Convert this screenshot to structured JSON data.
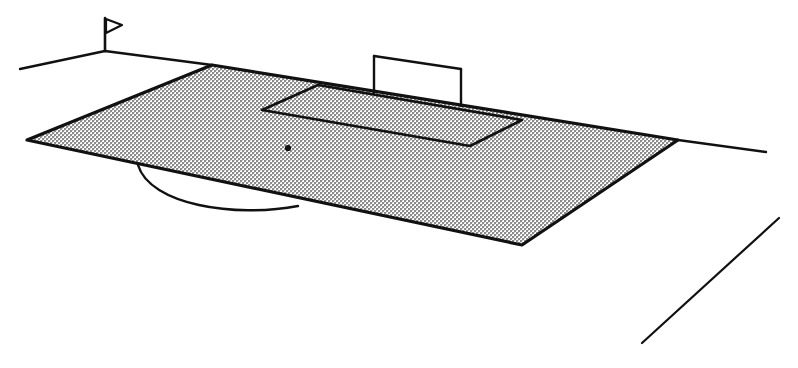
{
  "figure": {
    "caption": "",
    "background_color": "#ffffff",
    "ink_color": "#1a1a1a",
    "fill_color": "#d9d9d9"
  },
  "scene": {
    "type": "line-drawing",
    "subject": "association football (soccer) field in oblique perspective",
    "elements": [
      "corner-flag",
      "touchline-extension-left",
      "playing-field-half",
      "penalty-area",
      "goal",
      "penalty-spot",
      "center-circle-arc",
      "touchline-extension-right",
      "stray-diagonal-line"
    ]
  },
  "geometry": {
    "field": {
      "name": "playing-field-half",
      "label": "field surface",
      "points": "212,65 678,140 522,245 27,140",
      "fill": "#d9d9d9",
      "stroke": "#111111",
      "stroke_width": 3.2
    },
    "penalty_area": {
      "name": "penalty-area",
      "label": "penalty box",
      "points": "318,85 522,120 470,146 262,110",
      "stroke": "#111111",
      "stroke_width": 2.6
    },
    "goal": {
      "name": "goal",
      "label": "goal frame",
      "left_post": {
        "x": 374,
        "y_top": 56,
        "y_base": 93
      },
      "right_post": {
        "x": 461,
        "y_top": 69,
        "y_base": 106
      },
      "crossbar": "374,56 461,69",
      "stroke": "#111111",
      "stroke_width": 2.4
    },
    "penalty_spot": {
      "name": "penalty-spot",
      "label": "penalty spot",
      "cx": 288,
      "cy": 148,
      "r": 3.1,
      "fill": "#111111"
    },
    "center_arc": {
      "name": "center-circle-arc",
      "label": "centre circle arc",
      "path": "M 138,165 C 150,205 235,218 298,206",
      "stroke": "#111111",
      "stroke_width": 2.4
    },
    "corner_flag": {
      "name": "corner-flag",
      "label": "corner flag",
      "pole": "105,18 105,51",
      "pennant": "106,19 122,25 106,33",
      "stroke": "#111111",
      "stroke_width": 2.6
    },
    "touchline_left": {
      "name": "touchline-extension-left",
      "label": "left touchline extension",
      "path": "M 20,69 L 105,51 L 212,65",
      "stroke": "#111111",
      "stroke_width": 2.4
    },
    "touchline_right": {
      "name": "touchline-extension-right",
      "label": "right touchline extension",
      "path": "M 678,140 L 766,152",
      "stroke": "#111111",
      "stroke_width": 2.4
    },
    "stray_line": {
      "name": "stray-diagonal-line",
      "label": "lower right diagonal line",
      "path": "M 642,343 L 779,218",
      "stroke": "#111111",
      "stroke_width": 2.2
    }
  }
}
